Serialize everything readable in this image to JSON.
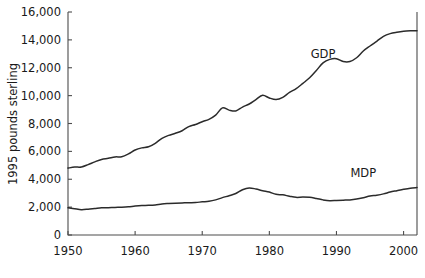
{
  "chart_data": {
    "type": "line",
    "title": "",
    "xlabel": "",
    "ylabel": "1995 pounds sterling",
    "xlim": [
      1950,
      2002
    ],
    "ylim": [
      0,
      16000
    ],
    "xticks": [
      1950,
      1960,
      1970,
      1980,
      1990,
      2000
    ],
    "xtick_labels": [
      "1950",
      "1960",
      "1970",
      "1980",
      "1990",
      "2000"
    ],
    "yticks": [
      0,
      2000,
      4000,
      6000,
      8000,
      10000,
      12000,
      14000,
      16000
    ],
    "ytick_labels": [
      "0",
      "2,000",
      "4,000",
      "6,000",
      "8,000",
      "10,000",
      "12,000",
      "14,000",
      "16,000"
    ],
    "grid": false,
    "legend_position": "inline-annotation",
    "line_color": "#2b2b2b",
    "axis_color": "#4d4d4d",
    "x": [
      1950,
      1951,
      1952,
      1953,
      1954,
      1955,
      1956,
      1957,
      1958,
      1959,
      1960,
      1961,
      1962,
      1963,
      1964,
      1965,
      1966,
      1967,
      1968,
      1969,
      1970,
      1971,
      1972,
      1973,
      1974,
      1975,
      1976,
      1977,
      1978,
      1979,
      1980,
      1981,
      1982,
      1983,
      1984,
      1985,
      1986,
      1987,
      1988,
      1989,
      1990,
      1991,
      1992,
      1993,
      1994,
      1995,
      1996,
      1997,
      1998,
      1999,
      2000,
      2001,
      2002
    ],
    "series": [
      {
        "name": "GDP",
        "label": "GDP",
        "label_x": 1988,
        "label_y": 12700,
        "values": [
          4800,
          4870,
          4880,
          5050,
          5250,
          5420,
          5500,
          5600,
          5620,
          5820,
          6100,
          6250,
          6330,
          6580,
          6940,
          7150,
          7300,
          7480,
          7780,
          7930,
          8130,
          8300,
          8600,
          9120,
          8960,
          8900,
          9180,
          9400,
          9720,
          10020,
          9830,
          9720,
          9880,
          10230,
          10500,
          10880,
          11280,
          11800,
          12350,
          12600,
          12650,
          12450,
          12450,
          12720,
          13200,
          13560,
          13900,
          14250,
          14450,
          14550,
          14620,
          14650,
          14660
        ]
      },
      {
        "name": "MDP",
        "label": "MDP",
        "label_x": 1994,
        "label_y": 4150,
        "values": [
          1950,
          1880,
          1820,
          1850,
          1900,
          1950,
          1960,
          1980,
          1990,
          2020,
          2080,
          2120,
          2130,
          2160,
          2230,
          2260,
          2280,
          2300,
          2320,
          2330,
          2380,
          2420,
          2520,
          2680,
          2820,
          2980,
          3250,
          3380,
          3300,
          3180,
          3080,
          2920,
          2880,
          2780,
          2700,
          2720,
          2700,
          2620,
          2520,
          2460,
          2480,
          2500,
          2520,
          2580,
          2680,
          2800,
          2860,
          2950,
          3080,
          3180,
          3280,
          3360,
          3400
        ]
      }
    ]
  }
}
